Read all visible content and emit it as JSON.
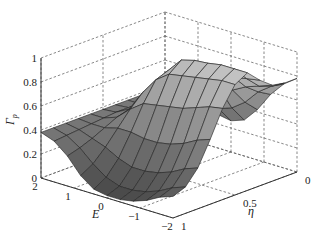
{
  "chart_data": {
    "type": "surface3d",
    "title": "",
    "xlabel": "η",
    "ylabel": "E",
    "zlabel": "Γ_p",
    "zlabel_display": "Γ",
    "zlabel_sub": "p",
    "x_ticks": [
      "0",
      "0.5",
      "1"
    ],
    "y_ticks": [
      "2",
      "1",
      "0",
      "−1",
      "−2"
    ],
    "z_ticks": [
      "0",
      "0.2",
      "0.4",
      "0.6",
      "0.8",
      "1"
    ],
    "xlim": [
      0,
      1
    ],
    "ylim": [
      -2,
      2
    ],
    "zlim": [
      0,
      1
    ],
    "grid": true,
    "colormap": "gray",
    "eta": [
      0,
      0.1,
      0.2,
      0.3,
      0.4,
      0.5,
      0.6,
      0.7,
      0.8,
      0.9,
      1.0
    ],
    "E": [
      2,
      1.6,
      1.2,
      0.8,
      0.4,
      0,
      -0.4,
      -0.8,
      -1.2,
      -1.6,
      -2
    ],
    "z_rows_by_E": [
      [
        0.38,
        0.38,
        0.38,
        0.38,
        0.38,
        0.38,
        0.38,
        0.38,
        0.38,
        0.38,
        0.38
      ],
      [
        0.36,
        0.37,
        0.38,
        0.38,
        0.39,
        0.39,
        0.38,
        0.37,
        0.36,
        0.35,
        0.34
      ],
      [
        0.33,
        0.36,
        0.4,
        0.44,
        0.46,
        0.45,
        0.42,
        0.37,
        0.32,
        0.28,
        0.25
      ],
      [
        0.3,
        0.38,
        0.5,
        0.6,
        0.64,
        0.62,
        0.52,
        0.4,
        0.28,
        0.18,
        0.12
      ],
      [
        0.28,
        0.4,
        0.58,
        0.74,
        0.8,
        0.76,
        0.6,
        0.4,
        0.22,
        0.1,
        0.04
      ],
      [
        0.26,
        0.4,
        0.62,
        0.82,
        0.92,
        0.84,
        0.62,
        0.38,
        0.18,
        0.06,
        0.02
      ],
      [
        0.3,
        0.44,
        0.64,
        0.82,
        0.95,
        0.86,
        0.64,
        0.38,
        0.18,
        0.06,
        0.02
      ],
      [
        0.42,
        0.52,
        0.66,
        0.82,
        0.96,
        0.88,
        0.66,
        0.4,
        0.2,
        0.08,
        0.04
      ],
      [
        0.58,
        0.64,
        0.72,
        0.84,
        0.98,
        0.9,
        0.7,
        0.44,
        0.24,
        0.12,
        0.08
      ],
      [
        0.7,
        0.72,
        0.76,
        0.86,
        0.98,
        0.92,
        0.74,
        0.5,
        0.3,
        0.18,
        0.14
      ],
      [
        0.78,
        0.78,
        0.8,
        0.88,
        0.98,
        0.92,
        0.76,
        0.54,
        0.34,
        0.22,
        0.18
      ]
    ],
    "projection": {
      "origin_front": [
        173,
        218
      ],
      "e_axis_start": [
        41,
        178
      ],
      "eta_axis_end": [
        297,
        172
      ],
      "z_unit_px": 120
    }
  }
}
